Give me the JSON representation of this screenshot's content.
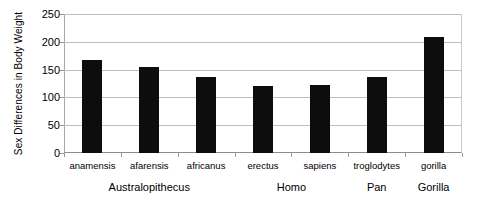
{
  "chart_data": {
    "type": "bar",
    "title": "",
    "xlabel": "",
    "ylabel": "Sex Differences in Body Weight",
    "ylim": [
      0,
      250
    ],
    "ytick_values": [
      0,
      50,
      100,
      150,
      200,
      250
    ],
    "ytick_labels": [
      "0",
      "50",
      "100",
      "150",
      "200",
      "250"
    ],
    "grid": true,
    "legend": "none",
    "categories": [
      "anamensis",
      "afarensis",
      "africanus",
      "erectus",
      "sapiens",
      "troglodytes",
      "gorilla"
    ],
    "values": [
      168,
      154,
      136,
      121,
      122,
      136,
      208
    ],
    "groups": [
      {
        "label": "Australopithecus",
        "categories": [
          "anamensis",
          "afarensis",
          "africanus"
        ]
      },
      {
        "label": "Homo",
        "categories": [
          "erectus",
          "sapiens"
        ]
      },
      {
        "label": "Pan",
        "categories": [
          "troglodytes"
        ]
      },
      {
        "label": "Gorilla",
        "categories": [
          "gorilla"
        ]
      }
    ],
    "bar_color": "#0d0d0d",
    "grid_color": "#bfbfbf",
    "background_color": "#ffffff"
  }
}
